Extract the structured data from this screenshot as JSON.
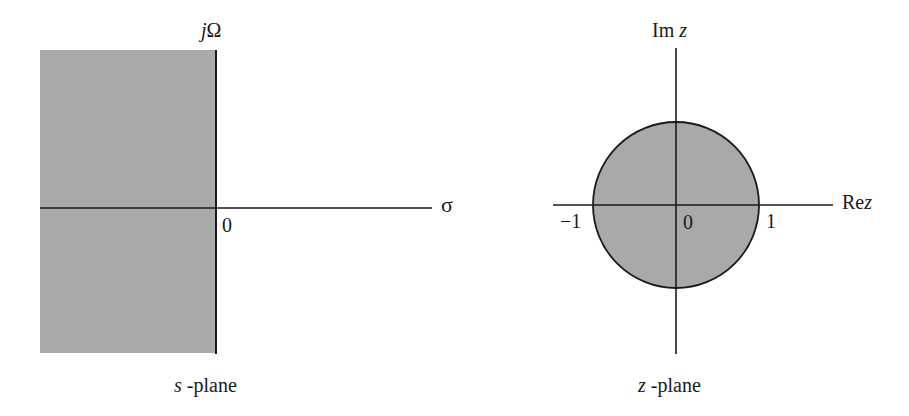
{
  "colors": {
    "shade": "#a9a9a9",
    "line": "#1a1a1a",
    "background": "#ffffff"
  },
  "s_plane": {
    "vertical_axis_label_prefix": "j",
    "vertical_axis_label_symbol": "Ω",
    "horizontal_axis_label": "σ",
    "origin_label": "0",
    "caption_var": "s",
    "caption_text": " -plane",
    "shaded_region": "left half-plane (σ < 0)"
  },
  "z_plane": {
    "vertical_axis_label_prefix": "Im ",
    "vertical_axis_label_var": "z",
    "horizontal_axis_label_prefix": "Re",
    "horizontal_axis_label_var": "z",
    "origin_label": "0",
    "tick_neg_one": "−1",
    "tick_pos_one": "1",
    "caption_var": "z",
    "caption_text": " -plane",
    "shaded_region": "interior of unit circle (|z| < 1)"
  }
}
